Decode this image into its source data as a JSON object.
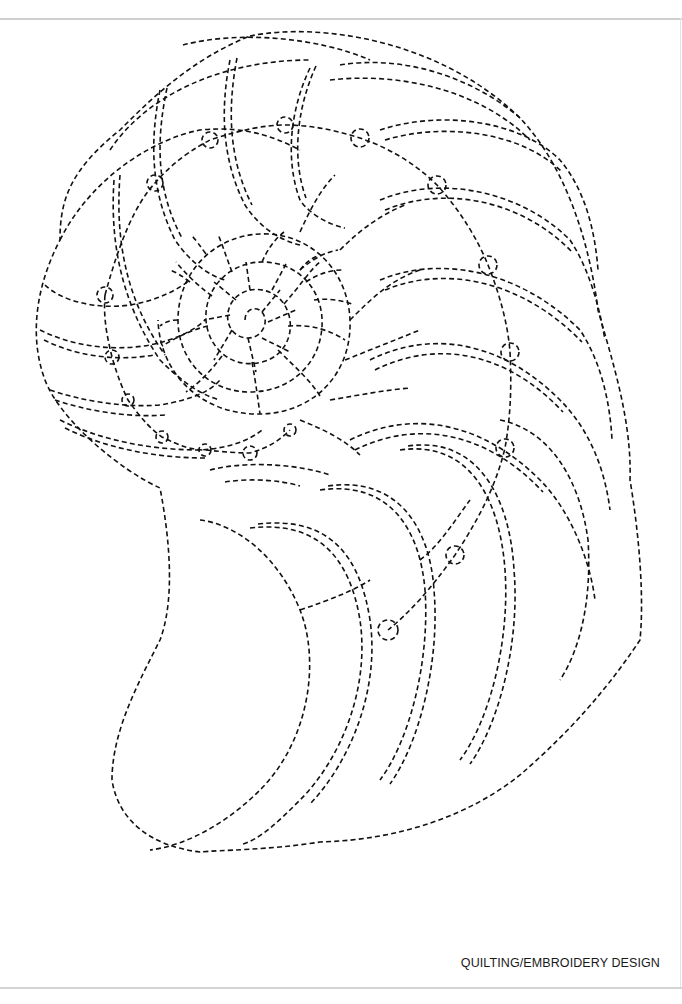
{
  "page": {
    "caption": "QUILTING/EMBROIDERY DESIGN",
    "style": "dashed stitch lines on white",
    "colors": {
      "stroke": "#111111",
      "background": "#ffffff",
      "rule": "#cfcfcf"
    }
  }
}
